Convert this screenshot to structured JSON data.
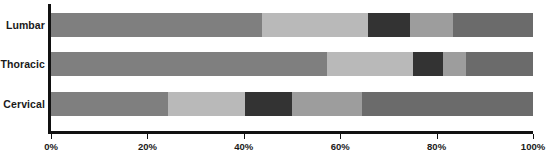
{
  "chart_data": {
    "type": "bar",
    "orientation": "horizontal",
    "stacked": true,
    "stack_mode": "percent",
    "title": "",
    "subtitle": "",
    "xlabel": "",
    "ylabel": "",
    "categories": [
      "Lumbar",
      "Thoracic",
      "Cervical"
    ],
    "xlim": [
      0,
      100
    ],
    "xticks": [
      0,
      20,
      40,
      60,
      80,
      100
    ],
    "xtick_labels": [
      "0%",
      "20%",
      "40%",
      "60%",
      "80%",
      "100%"
    ],
    "grid": false,
    "legend": null,
    "legend_position": "none",
    "annotations": [],
    "series": [
      {
        "name": "Segment 1",
        "color": "#7f7f7f",
        "values": [
          43.8,
          57.3,
          24.3
        ]
      },
      {
        "name": "Segment 2",
        "color": "#b9b9b9",
        "values": [
          22.0,
          17.8,
          16.0
        ]
      },
      {
        "name": "Segment 3",
        "color": "#333333",
        "values": [
          8.7,
          6.2,
          9.8
        ]
      },
      {
        "name": "Segment 4",
        "color": "#9d9d9d",
        "values": [
          8.9,
          4.8,
          14.5
        ]
      },
      {
        "name": "Segment 5",
        "color": "#6b6b6b",
        "values": [
          16.6,
          13.9,
          35.4
        ]
      }
    ],
    "rows": [
      {
        "category": "Lumbar",
        "segments": [
          {
            "value": 43.8,
            "color": "#7f7f7f"
          },
          {
            "value": 22.0,
            "color": "#b9b9b9"
          },
          {
            "value": 8.7,
            "color": "#333333"
          },
          {
            "value": 8.9,
            "color": "#9d9d9d"
          },
          {
            "value": 16.6,
            "color": "#6b6b6b"
          }
        ]
      },
      {
        "category": "Thoracic",
        "segments": [
          {
            "value": 57.3,
            "color": "#7f7f7f"
          },
          {
            "value": 17.8,
            "color": "#b9b9b9"
          },
          {
            "value": 6.2,
            "color": "#333333"
          },
          {
            "value": 4.8,
            "color": "#9d9d9d"
          },
          {
            "value": 13.9,
            "color": "#6b6b6b"
          }
        ]
      },
      {
        "category": "Cervical",
        "segments": [
          {
            "value": 24.3,
            "color": "#7f7f7f"
          },
          {
            "value": 16.0,
            "color": "#b9b9b9"
          },
          {
            "value": 9.8,
            "color": "#333333"
          },
          {
            "value": 14.5,
            "color": "#9d9d9d"
          },
          {
            "value": 35.4,
            "color": "#6b6b6b"
          }
        ]
      }
    ]
  },
  "axes": {
    "axis_color": "#111111",
    "background": "#ffffff"
  },
  "layout": {
    "plot_left_px": 51,
    "plot_right_px": 533,
    "bar_tops_px": [
      13,
      52,
      92
    ],
    "bar_height_px": 24
  }
}
